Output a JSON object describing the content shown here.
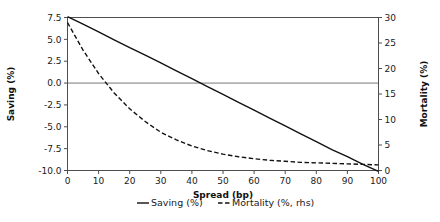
{
  "chart_data": {
    "type": "line",
    "title": "",
    "xlabel": "Spread (bp)",
    "ylabel": "Saving (%)",
    "y2label": "Mortality (%)",
    "xlim": [
      0,
      100
    ],
    "ylim": [
      -10.0,
      7.5
    ],
    "y2lim": [
      0,
      30
    ],
    "grid": false,
    "legend_position": "bottom-center",
    "zero_reference_line": 0.0,
    "xticks": [
      0,
      10,
      20,
      30,
      40,
      50,
      60,
      70,
      80,
      90,
      100
    ],
    "xtick_labels": [
      "0",
      "10",
      "20",
      "30",
      "40",
      "50",
      "60",
      "70",
      "80",
      "90",
      "100"
    ],
    "yticks": [
      7.5,
      5.0,
      2.5,
      0.0,
      -2.5,
      -5.0,
      -7.5,
      -10.0
    ],
    "ytick_labels": [
      "7.5",
      "5.0",
      "2.5",
      "0.0",
      "-2.5",
      "-5.0",
      "-7.5",
      "-10.0"
    ],
    "y2ticks": [
      0,
      5,
      10,
      15,
      20,
      25,
      30
    ],
    "y2tick_labels": [
      "0",
      "5",
      "10",
      "15",
      "20",
      "25",
      "30"
    ],
    "x": [
      0,
      5,
      10,
      15,
      20,
      25,
      30,
      35,
      40,
      45,
      50,
      55,
      60,
      65,
      70,
      75,
      80,
      85,
      90,
      95,
      100
    ],
    "series": [
      {
        "name": "Saving (%)",
        "axis": "left",
        "style": "solid",
        "color": "#111111",
        "values": [
          7.6,
          6.75,
          5.85,
          4.95,
          4.05,
          3.2,
          2.3,
          1.4,
          0.5,
          -0.4,
          -1.3,
          -2.2,
          -3.1,
          -4.0,
          -4.9,
          -5.8,
          -6.7,
          -7.6,
          -8.4,
          -9.3,
          -10.1
        ]
      },
      {
        "name": "Mortality (%, rhs)",
        "axis": "right",
        "style": "dashed",
        "color": "#111111",
        "values": [
          29.0,
          23.6,
          19.0,
          15.2,
          12.1,
          9.6,
          7.5,
          6.0,
          4.8,
          3.9,
          3.2,
          2.7,
          2.3,
          2.0,
          1.8,
          1.6,
          1.5,
          1.4,
          1.3,
          1.2,
          1.1
        ]
      }
    ],
    "legend": [
      {
        "label": "Saving (%)",
        "style": "solid"
      },
      {
        "label": "Mortality (%, rhs)",
        "style": "dashed"
      }
    ]
  }
}
